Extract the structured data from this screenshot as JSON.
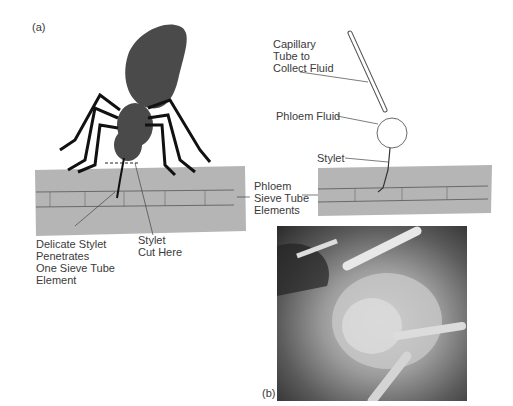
{
  "panel_a": {
    "label": "(a)",
    "labels": {
      "delicate_stylet": "Delicate Stylet\nPenetrates\nOne Sieve Tube\nElement",
      "stylet_cut": "Stylet\nCut Here",
      "phloem_sieve": "Phloem\nSieve Tube\nElements"
    }
  },
  "panel_right": {
    "labels": {
      "capillary": "Capillary\nTube to\nCollect Fluid",
      "phloem_fluid": "Phloem Fluid",
      "stylet": "Stylet"
    }
  },
  "panel_b": {
    "label": "(b)",
    "description": "Scanning electron micrograph of aphid feeding on plant stem"
  },
  "colors": {
    "tissue": "#b5b5b5",
    "aphid": "#4a4a4a",
    "line": "#444444"
  }
}
